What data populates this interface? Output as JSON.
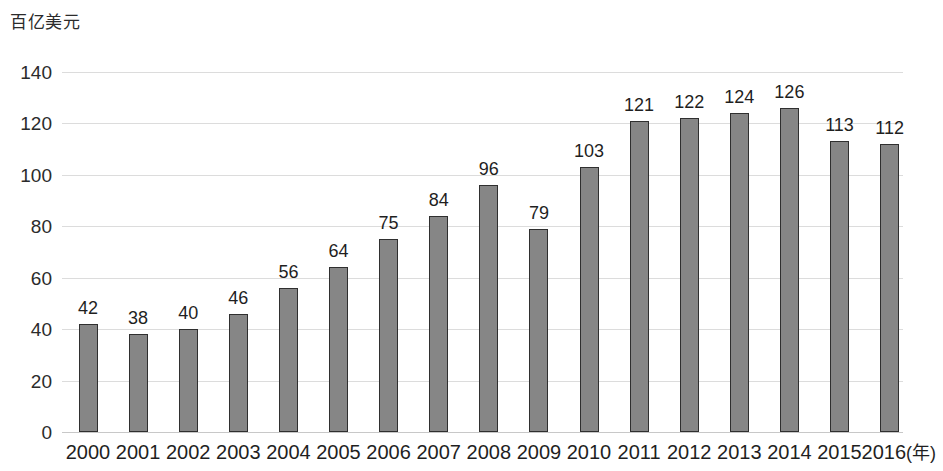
{
  "chart_data": {
    "type": "bar",
    "title": "",
    "subtitle": "",
    "ylabel": "百亿美元",
    "xlabel": "(年)",
    "xlabel_inline_suffix": "(年)",
    "categories": [
      "2000",
      "2001",
      "2002",
      "2003",
      "2004",
      "2005",
      "2006",
      "2007",
      "2008",
      "2009",
      "2010",
      "2011",
      "2012",
      "2013",
      "2014",
      "2015",
      "2016"
    ],
    "values": [
      42,
      38,
      40,
      46,
      56,
      64,
      75,
      84,
      96,
      79,
      103,
      121,
      122,
      124,
      126,
      113,
      112
    ],
    "data_labels": [
      "42",
      "38",
      "40",
      "46",
      "56",
      "64",
      "75",
      "84",
      "96",
      "79",
      "103",
      "121",
      "122",
      "124",
      "126",
      "113",
      "112"
    ],
    "ylim": [
      0,
      140
    ],
    "ytick_values": [
      0,
      20,
      40,
      60,
      80,
      100,
      120,
      140
    ],
    "ytick_labels": [
      "0",
      "20",
      "40",
      "60",
      "80",
      "100",
      "120",
      "140"
    ],
    "grid": true,
    "grid_axis": "y",
    "legend": false,
    "legend_position": "none",
    "series": [
      {
        "name": "",
        "values": [
          42,
          38,
          40,
          46,
          56,
          64,
          75,
          84,
          96,
          79,
          103,
          121,
          122,
          124,
          126,
          113,
          112
        ]
      }
    ],
    "colors": {
      "bar_fill": "#868686",
      "bar_stroke": "#2f2f2f",
      "gridline": "#dcdcdc",
      "baseline": "#c8c8c8",
      "text": "#1f1f1f",
      "background": "#ffffff"
    }
  }
}
